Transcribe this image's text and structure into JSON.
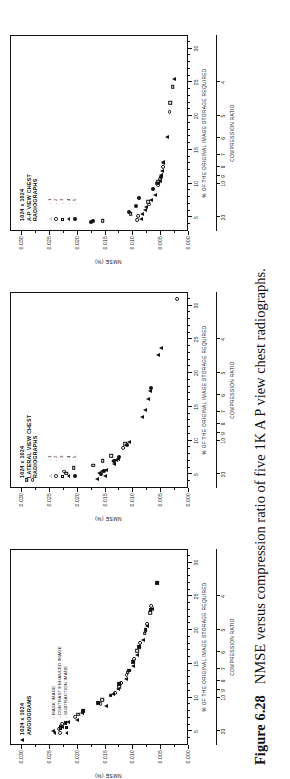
{
  "caption": {
    "figure_number": "Figure 6.28",
    "text": "NMSE versus compression ratio of five 1K A P view chest radiographs."
  },
  "axes_common": {
    "y_title": "NMSE (%)",
    "x_title": "% OF THE ORIGINAL IMAGE STORAGE REQUIRED",
    "cr_title": "COMPRESSION RATIO",
    "y_ticks": [
      "0.030",
      "0.025",
      "0.020",
      "0.015",
      "0.010",
      "0.005",
      "0.000"
    ],
    "y_values": [
      0.03,
      0.025,
      0.02,
      0.015,
      0.01,
      0.005,
      0.0
    ],
    "x_ticks": [
      "5",
      "10",
      "15",
      "20",
      "25",
      "30"
    ],
    "x_values": [
      5,
      10,
      15,
      20,
      25,
      30
    ],
    "cr_ticks": [
      "20",
      "10",
      "9",
      "8",
      "7",
      "6",
      "5",
      "4"
    ],
    "cr_values": [
      5,
      10,
      11.1,
      12.5,
      14.3,
      16.7,
      20,
      25
    ],
    "ylim": [
      0.0,
      0.032
    ],
    "xlim": [
      3,
      32
    ]
  },
  "panels": [
    {
      "id": "angiograms",
      "title_lines": [
        "1024 x 1024",
        "ANGIOGRAMS"
      ],
      "legend": [
        {
          "marks": [
            "tri-f"
          ],
          "label": "- MASK IMAGE"
        },
        {
          "marks": [
            "cir-o",
            "sq-o"
          ],
          "label": "- CONTRAST ENHANCED IMAGE"
        },
        {
          "marks": [
            "tri-f",
            "sq-f"
          ],
          "label": "- SUBTRACTION IMAGE"
        }
      ]
    },
    {
      "id": "lateral-view-chest",
      "title_lines": [
        "1024 x 1024",
        "LATERAL VIEW CHEST",
        "RADIOGRAPHS"
      ],
      "legend": [
        {
          "marks": [
            "tri-o"
          ],
          "label": "- 1"
        },
        {
          "marks": [
            "cir-o"
          ],
          "label": "- 2"
        },
        {
          "marks": [
            "sq-o"
          ],
          "label": "- 3"
        },
        {
          "marks": [
            "tri-f"
          ],
          "label": "- 4"
        },
        {
          "marks": [
            "cir-f"
          ],
          "label": "- 5"
        }
      ]
    },
    {
      "id": "ap-view-chest",
      "title_lines": [
        "1024 x 1024",
        "A-P VIEW CHEST",
        "RADIOGRAPHS"
      ],
      "legend": [
        {
          "marks": [
            "tri-o"
          ],
          "label": "- 1"
        },
        {
          "marks": [
            "cir-o"
          ],
          "label": "- 2"
        },
        {
          "marks": [
            "sq-o"
          ],
          "label": "- 3"
        },
        {
          "marks": [
            "tri-f"
          ],
          "label": "- 4"
        },
        {
          "marks": [
            "cir-f"
          ],
          "label": "- 5"
        }
      ]
    }
  ],
  "chart_data": [
    {
      "type": "scatter",
      "panel": "angiograms",
      "title": "1024 x 1024 ANGIOGRAMS",
      "xlabel": "% OF THE ORIGINAL IMAGE STORAGE REQUIRED",
      "ylabel": "NMSE (%)",
      "xlim": [
        3,
        32
      ],
      "ylim": [
        0.0,
        0.032
      ],
      "grid": false,
      "legend_position": "upper-left-inside",
      "series": [
        {
          "name": "MASK IMAGE",
          "marker": "tri-f",
          "points": [
            [
              3.6,
              0.03
            ],
            [
              4.9,
              0.0244
            ],
            [
              5.5,
              0.0229
            ],
            [
              6.2,
              0.0218
            ],
            [
              6.6,
              0.0201
            ],
            [
              7.6,
              0.0192
            ],
            [
              8.6,
              0.015
            ],
            [
              10.4,
              0.0137
            ],
            [
              11.2,
              0.0128
            ],
            [
              12.6,
              0.0113
            ],
            [
              14.5,
              0.0101
            ],
            [
              16.2,
              0.0094
            ],
            [
              18.4,
              0.0083
            ],
            [
              20.5,
              0.0075
            ],
            [
              23.0,
              0.0067
            ]
          ]
        },
        {
          "name": "CONTRAST ENHANCED IMAGE",
          "marker": "cir-o",
          "points": [
            [
              5.2,
              0.0234
            ],
            [
              6.0,
              0.0228
            ],
            [
              7.0,
              0.0205
            ],
            [
              8.9,
              0.0159
            ],
            [
              10.6,
              0.0133
            ],
            [
              12.0,
              0.0122
            ],
            [
              13.2,
              0.0112
            ],
            [
              15.6,
              0.0098
            ],
            [
              17.9,
              0.0088
            ],
            [
              20.8,
              0.0076
            ],
            [
              23.4,
              0.0068
            ]
          ]
        },
        {
          "name": "CONTRAST ENHANCED IMAGE",
          "marker": "sq-o",
          "points": [
            [
              5.6,
              0.0231
            ],
            [
              7.4,
              0.0199
            ],
            [
              9.5,
              0.0156
            ],
            [
              11.5,
              0.0126
            ],
            [
              13.6,
              0.011
            ],
            [
              16.8,
              0.0093
            ],
            [
              19.4,
              0.008
            ],
            [
              22.4,
              0.007
            ]
          ]
        },
        {
          "name": "SUBTRACTION IMAGE",
          "marker": "sq-f",
          "points": [
            [
              6.1,
              0.0222
            ],
            [
              7.9,
              0.019
            ],
            [
              9.1,
              0.0164
            ],
            [
              10.2,
              0.0141
            ],
            [
              11.9,
              0.0125
            ],
            [
              13.9,
              0.0108
            ],
            [
              15.1,
              0.01
            ],
            [
              17.4,
              0.0089
            ],
            [
              19.9,
              0.0078
            ],
            [
              22.9,
              0.0069
            ],
            [
              26.8,
              0.0058
            ]
          ]
        }
      ]
    },
    {
      "type": "scatter",
      "panel": "lateral-view-chest",
      "title": "1024 x 1024 LATERAL VIEW CHEST RADIOGRAPHS",
      "xlabel": "% OF THE ORIGINAL IMAGE STORAGE REQUIRED",
      "ylabel": "NMSE (%)",
      "xlim": [
        3,
        32
      ],
      "ylim": [
        0.0,
        0.032
      ],
      "grid": false,
      "legend_position": "upper-left-inside",
      "series": [
        {
          "name": "1",
          "marker": "tri-o",
          "points": [
            [
              4.2,
              0.0165
            ],
            [
              4.6,
              0.0151
            ],
            [
              5.5,
              0.0149
            ],
            [
              6.4,
              0.0135
            ],
            [
              7.2,
              0.0128
            ],
            [
              9.7,
              0.0108
            ],
            [
              13.4,
              0.0085
            ],
            [
              16.0,
              0.0074
            ],
            [
              22.5,
              0.0055
            ]
          ]
        },
        {
          "name": "2",
          "marker": "cir-o",
          "points": [
            [
              4.0,
              0.0281
            ],
            [
              5.3,
              0.0225
            ],
            [
              8.8,
              0.0118
            ],
            [
              30.8,
              0.0021
            ]
          ]
        },
        {
          "name": "3",
          "marker": "sq-o",
          "points": [
            [
              4.1,
              0.0292
            ],
            [
              5.0,
              0.0221
            ],
            [
              5.8,
              0.0207
            ],
            [
              6.2,
              0.0172
            ],
            [
              6.9,
              0.0155
            ],
            [
              7.6,
              0.014
            ],
            [
              9.4,
              0.0115
            ]
          ]
        },
        {
          "name": "4",
          "marker": "tri-f",
          "points": [
            [
              5.0,
              0.0161
            ],
            [
              5.3,
              0.0157
            ],
            [
              6.8,
              0.0137
            ],
            [
              7.0,
              0.0132
            ],
            [
              14.4,
              0.0079
            ],
            [
              17.2,
              0.007
            ],
            [
              23.6,
              0.0051
            ]
          ]
        },
        {
          "name": "5",
          "marker": "cir-f",
          "points": [
            [
              4.9,
              0.0159
            ],
            [
              5.4,
              0.0152
            ],
            [
              6.9,
              0.0134
            ],
            [
              7.4,
              0.0125
            ],
            [
              9.2,
              0.0111
            ],
            [
              17.6,
              0.0068
            ]
          ]
        }
      ]
    },
    {
      "type": "scatter",
      "panel": "ap-view-chest",
      "title": "1024 x 1024 A-P VIEW CHEST RADIOGRAPHS",
      "xlabel": "% OF THE ORIGINAL IMAGE STORAGE REQUIRED",
      "ylabel": "NMSE (%)",
      "xlim": [
        3,
        32
      ],
      "ylim": [
        0.0,
        0.032
      ],
      "grid": false,
      "legend_position": "upper-left-inside",
      "series": [
        {
          "name": "1",
          "marker": "tri-o",
          "points": [
            [
              4.6,
              0.0087
            ],
            [
              5.3,
              0.0084
            ],
            [
              6.4,
              0.0078
            ],
            [
              8.2,
              0.0062
            ],
            [
              10.3,
              0.0053
            ],
            [
              11.8,
              0.0048
            ],
            [
              13.0,
              0.0046
            ]
          ]
        },
        {
          "name": "2",
          "marker": "cir-o",
          "points": [
            [
              4.5,
              0.0094
            ],
            [
              5.1,
              0.0092
            ],
            [
              6.8,
              0.0072
            ],
            [
              9.6,
              0.0056
            ],
            [
              10.6,
              0.0052
            ],
            [
              12.3,
              0.0047
            ],
            [
              20.5,
              0.0035
            ]
          ]
        },
        {
          "name": "3",
          "marker": "sq-o",
          "points": [
            [
              4.4,
              0.0155
            ],
            [
              5.4,
              0.0105
            ],
            [
              7.2,
              0.0073
            ],
            [
              9.9,
              0.0058
            ],
            [
              10.1,
              0.0055
            ],
            [
              21.8,
              0.0034
            ],
            [
              24.2,
              0.0029
            ]
          ]
        },
        {
          "name": "4",
          "marker": "tri-f",
          "points": [
            [
              6.0,
              0.0079
            ],
            [
              7.4,
              0.0069
            ],
            [
              10.0,
              0.0056
            ],
            [
              11.2,
              0.0051
            ],
            [
              12.9,
              0.0046
            ],
            [
              16.8,
              0.0039
            ],
            [
              25.3,
              0.0027
            ]
          ]
        },
        {
          "name": "5",
          "marker": "cir-f",
          "points": [
            [
              4.2,
              0.0176
            ],
            [
              4.4,
              0.0172
            ],
            [
              5.6,
              0.0107
            ],
            [
              6.6,
              0.0096
            ],
            [
              7.8,
              0.0089
            ],
            [
              9.0,
              0.0064
            ],
            [
              10.8,
              0.005
            ]
          ]
        }
      ]
    }
  ]
}
